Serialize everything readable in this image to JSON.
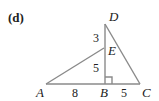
{
  "figure": {
    "tag": "(d)",
    "points": {
      "A": "A",
      "B": "B",
      "C": "C",
      "D": "D",
      "E": "E"
    },
    "segment_lengths": {
      "DE": "3",
      "EB": "5",
      "AB": "8",
      "BC": "5"
    },
    "right_angle_at": "B",
    "line_color": "#8a8a8a"
  }
}
